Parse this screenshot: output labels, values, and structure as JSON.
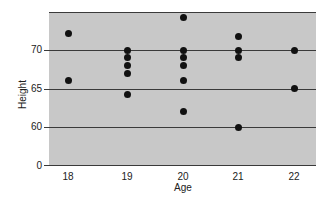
{
  "chart_data": {
    "type": "scatter",
    "title": "",
    "xlabel": "Age",
    "ylabel": "Height",
    "x_ticks": [
      "18",
      "19",
      "20",
      "21",
      "22"
    ],
    "y_ticks": [
      "0",
      "60",
      "65",
      "70"
    ],
    "y_axis_note": "broken axis: 0 at bottom, then 60-75 range",
    "ylim": [
      58,
      75
    ],
    "grid": true,
    "legend": null,
    "points": [
      {
        "x": 18,
        "y": 72.2
      },
      {
        "x": 18,
        "y": 66
      },
      {
        "x": 19,
        "y": 70
      },
      {
        "x": 19,
        "y": 69
      },
      {
        "x": 19,
        "y": 68
      },
      {
        "x": 19,
        "y": 67
      },
      {
        "x": 19,
        "y": 64.2
      },
      {
        "x": 20,
        "y": 74.2
      },
      {
        "x": 20,
        "y": 70
      },
      {
        "x": 20,
        "y": 69
      },
      {
        "x": 20,
        "y": 68
      },
      {
        "x": 20,
        "y": 66
      },
      {
        "x": 20,
        "y": 62
      },
      {
        "x": 21,
        "y": 71.7
      },
      {
        "x": 21,
        "y": 70
      },
      {
        "x": 21,
        "y": 69
      },
      {
        "x": 21,
        "y": 60
      },
      {
        "x": 22,
        "y": 70
      },
      {
        "x": 22,
        "y": 65
      }
    ]
  },
  "colors": {
    "plot_background": "#c8c8c8",
    "gridline": "#3a3a3a",
    "point": "#111111"
  }
}
